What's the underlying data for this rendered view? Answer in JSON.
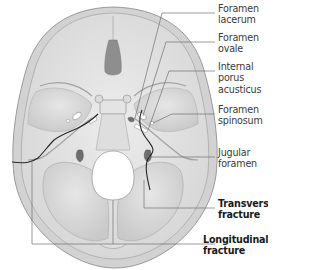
{
  "figure": {
    "colors": {
      "bone": "#d9d9d9",
      "bone_light": "#e8e8e8",
      "bone_dark": "#b8b8b8",
      "fracture_line": "#2a2a2a",
      "leader_line": "#6a6a6a",
      "label_text": "#3a3a3a"
    }
  },
  "labels": [
    {
      "id": "foramen-lacerum",
      "line1": "Foramen",
      "line2": "lacerum",
      "bold": false
    },
    {
      "id": "foramen-ovale",
      "line1": "Foramen",
      "line2": "ovale",
      "bold": false
    },
    {
      "id": "internal-porus-acusticus",
      "line1": "Internal",
      "line2": "porus",
      "line3": "acusticus",
      "bold": false
    },
    {
      "id": "foramen-spinosum",
      "line1": "Foramen",
      "line2": "spinosum",
      "bold": false
    },
    {
      "id": "jugular-foramen",
      "line1": "Jugular",
      "line2": "foramen",
      "bold": false
    },
    {
      "id": "transverse-fracture",
      "line1": "Transverse",
      "line2": "fracture",
      "bold": true
    },
    {
      "id": "longitudinal-fracture",
      "line1": "Longitudinal",
      "line2": "fracture",
      "bold": true
    }
  ]
}
